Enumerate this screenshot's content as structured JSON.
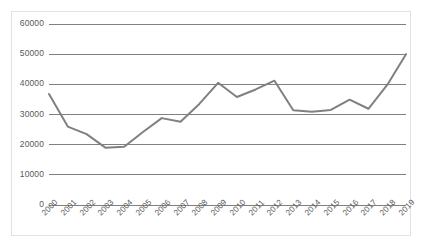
{
  "chart_data": {
    "type": "line",
    "title": "",
    "xlabel": "",
    "ylabel": "",
    "categories": [
      "2000",
      "2001",
      "2002",
      "2003",
      "2004",
      "2005",
      "2006",
      "2007",
      "2008",
      "2009",
      "2010",
      "2011",
      "2012",
      "2013",
      "2014",
      "2015",
      "2016",
      "2017",
      "2018",
      "2019"
    ],
    "values": [
      36800,
      26000,
      23500,
      19000,
      19300,
      24200,
      28800,
      27600,
      33500,
      40500,
      35800,
      38300,
      41200,
      31400,
      30900,
      31500,
      34900,
      31900,
      39800,
      50000
    ],
    "series": [
      {
        "name": "Series 1",
        "values": [
          36800,
          26000,
          23500,
          19000,
          19300,
          24200,
          28800,
          27600,
          33500,
          40500,
          35800,
          38300,
          41200,
          31400,
          30900,
          31500,
          34900,
          31900,
          39800,
          50000
        ],
        "color": "#808080"
      }
    ],
    "ylim": [
      0,
      60000
    ],
    "yticks": [
      0,
      10000,
      20000,
      30000,
      40000,
      50000,
      60000
    ],
    "ytick_labels": [
      "0",
      "10000",
      "20000",
      "30000",
      "40000",
      "50000",
      "60000"
    ],
    "xtick_labels": [
      "2000",
      "2001",
      "2002",
      "2003",
      "2004",
      "2005",
      "2006",
      "2007",
      "2008",
      "2009",
      "2010",
      "2011",
      "2012",
      "2013",
      "2014",
      "2015",
      "2016",
      "2017",
      "2018",
      "2019"
    ],
    "xtick_rotation": -45,
    "grid": {
      "horizontal": true,
      "vertical": false,
      "color": "#808080"
    },
    "legend": {
      "visible": false,
      "position": "none"
    },
    "line_color": "#808080",
    "line_width": 2,
    "markers": false,
    "plot_background": "#ffffff",
    "border_color": "#e2e2e2"
  },
  "meta": {
    "title_remnant": ""
  }
}
